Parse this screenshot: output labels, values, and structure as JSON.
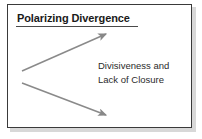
{
  "slide": {
    "title": "Polarizing Divergence",
    "caption": {
      "line1": "Divisiveness and",
      "line2": "Lack of Closure"
    }
  },
  "colors": {
    "border": "#3a3a3a",
    "title_text": "#1a1a1a",
    "title_underline": "#4a4a4a",
    "caption_text": "#2b2b2b",
    "arrow": "#888888",
    "background": "#ffffff",
    "shadow": "#b8b8b8"
  },
  "diagram": {
    "type": "divergence",
    "arrows": [
      {
        "name": "upward-divergence-arrow",
        "direction": "up-right",
        "x1": 14,
        "y1": 66,
        "x2": 98,
        "y2": 29
      },
      {
        "name": "downward-divergence-arrow",
        "direction": "down-right",
        "x1": 14,
        "y1": 78,
        "x2": 98,
        "y2": 110
      }
    ]
  }
}
